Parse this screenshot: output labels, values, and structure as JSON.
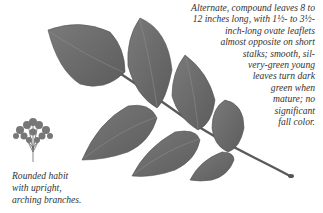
{
  "description": {
    "lines": [
      "Alternate, compound leaves 8 to",
      "12 inches long, with 1½- to 3½-",
      "inch-long ovate leaflets",
      "almost opposite on short",
      "stalks; smooth,  sil-",
      "very-green young",
      "leaves turn dark",
      "green when",
      "mature; no",
      "significant",
      "fall color."
    ]
  },
  "habit": {
    "icon": "shrub-silhouette-icon",
    "caption_lines": [
      "Rounded habit",
      "with upright,",
      "arching branches."
    ]
  },
  "illustration": {
    "subject": "compound-leaf",
    "leaf_color": "#6e6e6e",
    "stem_color": "#5a5a5a"
  }
}
